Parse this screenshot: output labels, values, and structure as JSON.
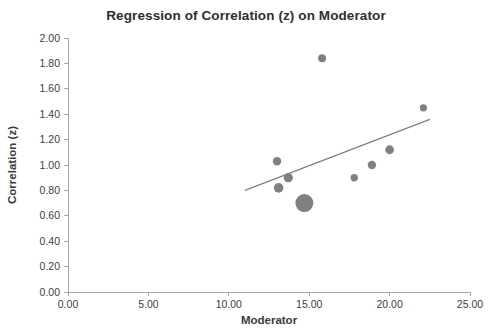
{
  "chart_data": {
    "type": "scatter",
    "title": "Regression of Correlation (z) on Moderator",
    "xlabel": "Moderator",
    "ylabel": "Correlation (z)",
    "xlim": [
      0,
      25
    ],
    "ylim": [
      0,
      2.0
    ],
    "xticks": [
      "0.00",
      "5.00",
      "10.00",
      "15.00",
      "20.00",
      "25.00"
    ],
    "xtick_values": [
      0,
      5,
      10,
      15,
      20,
      25
    ],
    "yticks": [
      "0.00",
      "0.20",
      "0.40",
      "0.60",
      "0.80",
      "1.00",
      "1.20",
      "1.40",
      "1.60",
      "1.80",
      "2.00"
    ],
    "ytick_values": [
      0,
      0.2,
      0.4,
      0.6,
      0.8,
      1.0,
      1.2,
      1.4,
      1.6,
      1.8,
      2.0
    ],
    "grid": false,
    "legend": "none",
    "marker_color": "#808080",
    "line_color": "#808080",
    "points": [
      {
        "x": 13.0,
        "y": 1.03,
        "size": 4.2
      },
      {
        "x": 13.1,
        "y": 0.82,
        "size": 4.8
      },
      {
        "x": 13.7,
        "y": 0.9,
        "size": 4.6
      },
      {
        "x": 14.7,
        "y": 0.7,
        "size": 9.0
      },
      {
        "x": 15.8,
        "y": 1.84,
        "size": 4.0
      },
      {
        "x": 17.8,
        "y": 0.9,
        "size": 3.7
      },
      {
        "x": 18.9,
        "y": 1.0,
        "size": 4.2
      },
      {
        "x": 20.0,
        "y": 1.12,
        "size": 4.4
      },
      {
        "x": 22.1,
        "y": 1.45,
        "size": 3.6
      }
    ],
    "trendline": {
      "x_start": 11.0,
      "y_start": 0.8,
      "x_end": 22.5,
      "y_end": 1.36
    }
  }
}
